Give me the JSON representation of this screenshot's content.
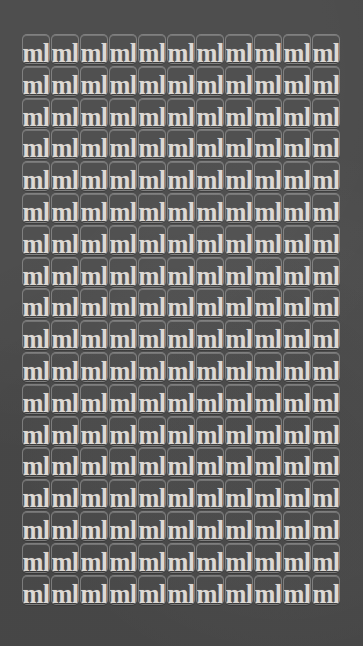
{
  "canvas": {
    "width": 363,
    "height": 646,
    "background_color": "#4a4a4a",
    "description": "repeating-tile-grid"
  },
  "grid": {
    "columns": 11,
    "rows": 18,
    "total_tiles": 198,
    "origin_x": 22,
    "origin_y": 34,
    "column_pitch": 29,
    "row_pitch": 31.8,
    "tile_width": 28,
    "tile_height": 30,
    "tile_corner_radius": 5,
    "tile_border_color": "#a8a8a8",
    "tile_label": "ml",
    "tile_label_color": "#ddd9d4"
  },
  "tiles": {
    "label": "ml"
  }
}
